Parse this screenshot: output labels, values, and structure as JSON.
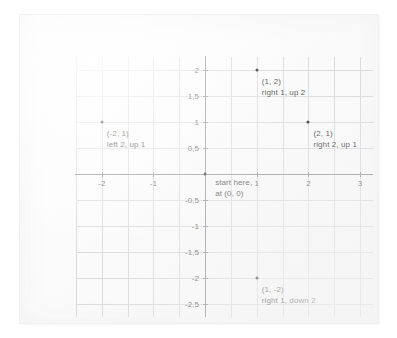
{
  "chart_data": {
    "type": "scatter",
    "title": "",
    "xlabel": "",
    "ylabel": "",
    "xlim": [
      -2.5,
      3.25
    ],
    "ylim": [
      -2.75,
      2.25
    ],
    "grid": true,
    "grid_step": 0.5,
    "legend": "none",
    "decimal_separator": ",",
    "x_ticks": [
      {
        "value": -2,
        "label": "-2"
      },
      {
        "value": -1,
        "label": "-1"
      },
      {
        "value": 1,
        "label": "1"
      },
      {
        "value": 2,
        "label": "2"
      },
      {
        "value": 3,
        "label": "3"
      }
    ],
    "y_ticks": [
      {
        "value": 2,
        "label": "2"
      },
      {
        "value": 1.5,
        "label": "1,5"
      },
      {
        "value": 1,
        "label": "1"
      },
      {
        "value": 0.5,
        "label": "0,5"
      },
      {
        "value": -0.5,
        "label": "-0,5"
      },
      {
        "value": -1,
        "label": "-1"
      },
      {
        "value": -1.5,
        "label": "-1,5"
      },
      {
        "value": -2,
        "label": "-2"
      },
      {
        "value": -2.5,
        "label": "-2,5"
      }
    ],
    "points": [
      {
        "x": 0,
        "y": 0,
        "coord_label": "",
        "note_lines": [
          "start here,",
          "at (0, 0)"
        ],
        "label_dx": 10,
        "label_dy": 3
      },
      {
        "x": 1,
        "y": 2,
        "coord_label": "(1, 2)",
        "note_lines": [
          "(1, 2)",
          "right 1, up 2"
        ],
        "label_dx": 5,
        "label_dy": 6
      },
      {
        "x": 2,
        "y": 1,
        "coord_label": "(2, 1)",
        "note_lines": [
          "(2, 1)",
          "right 2, up 1"
        ],
        "label_dx": 5,
        "label_dy": 6
      },
      {
        "x": -2,
        "y": 1,
        "coord_label": "(-2, 1)",
        "note_lines": [
          "(-2, 1)",
          "left 2, up 1"
        ],
        "label_dx": 5,
        "label_dy": 6
      },
      {
        "x": 1,
        "y": -2,
        "coord_label": "(1, -2)",
        "note_lines": [
          "(1, -2)",
          "right 1, down 2"
        ],
        "label_dx": 5,
        "label_dy": 6
      }
    ],
    "colors": {
      "gridline": "#d9dade",
      "axis": "#8e9094",
      "point": "#2b2b2b",
      "text": "#3c3e41",
      "tick_text": "#5b5d60",
      "paper": "#fbfbfb"
    }
  }
}
